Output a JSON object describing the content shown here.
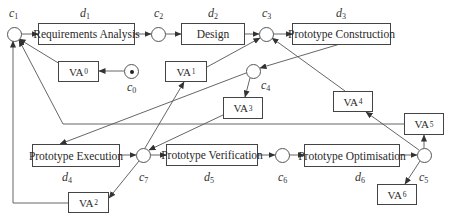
{
  "diagram": {
    "activities": [
      {
        "id": "d1",
        "label": "Requirements Analysis"
      },
      {
        "id": "d2",
        "label": "Design"
      },
      {
        "id": "d3",
        "label": "Prototype Construction"
      },
      {
        "id": "d4",
        "label": "Prototype Execution"
      },
      {
        "id": "d5",
        "label": "Prototype Verification"
      },
      {
        "id": "d6",
        "label": "Prototype Optimisation"
      }
    ],
    "activity_labels": {
      "d1": {
        "base": "d",
        "sub": "1"
      },
      "d2": {
        "base": "d",
        "sub": "2"
      },
      "d3": {
        "base": "d",
        "sub": "3"
      },
      "d4": {
        "base": "d",
        "sub": "4"
      },
      "d5": {
        "base": "d",
        "sub": "5"
      },
      "d6": {
        "base": "d",
        "sub": "6"
      }
    },
    "connectors": {
      "c0": {
        "base": "c",
        "sub": "0"
      },
      "c1": {
        "base": "c",
        "sub": "1"
      },
      "c2": {
        "base": "c",
        "sub": "2"
      },
      "c3": {
        "base": "c",
        "sub": "3"
      },
      "c4": {
        "base": "c",
        "sub": "4"
      },
      "c5": {
        "base": "c",
        "sub": "5"
      },
      "c6": {
        "base": "c",
        "sub": "6"
      },
      "c7": {
        "base": "c",
        "sub": "7"
      }
    },
    "value_activities": {
      "VA0": {
        "base": "VA",
        "sub": "0"
      },
      "VA1": {
        "base": "VA",
        "sub": "1"
      },
      "VA2": {
        "base": "VA",
        "sub": "2"
      },
      "VA3": {
        "base": "VA",
        "sub": "3"
      },
      "VA4": {
        "base": "VA",
        "sub": "4"
      },
      "VA5": {
        "base": "VA",
        "sub": "5"
      },
      "VA6": {
        "base": "VA",
        "sub": "6"
      }
    },
    "edges": [
      [
        "c0",
        "VA0"
      ],
      [
        "VA0",
        "c1"
      ],
      [
        "c1",
        "d1"
      ],
      [
        "d1",
        "c2"
      ],
      [
        "c2",
        "d2"
      ],
      [
        "d2",
        "c3"
      ],
      [
        "c3",
        "d3"
      ],
      [
        "d3",
        "c4"
      ],
      [
        "c4",
        "d4"
      ],
      [
        "c4",
        "VA3"
      ],
      [
        "VA3",
        "c7"
      ],
      [
        "d4",
        "c7"
      ],
      [
        "c7",
        "VA1"
      ],
      [
        "VA1",
        "c3"
      ],
      [
        "c7",
        "d5"
      ],
      [
        "c7",
        "VA2"
      ],
      [
        "VA2",
        "c1"
      ],
      [
        "d5",
        "c6"
      ],
      [
        "c6",
        "d6"
      ],
      [
        "d6",
        "c5"
      ],
      [
        "c5",
        "VA4"
      ],
      [
        "VA4",
        "c3"
      ],
      [
        "c5",
        "VA5"
      ],
      [
        "VA5",
        "c1"
      ],
      [
        "c5",
        "VA6"
      ]
    ]
  }
}
